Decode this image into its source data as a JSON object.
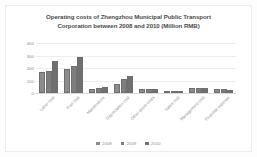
{
  "chart_data": {
    "type": "bar",
    "title": "Operating costs of Zhengzhou Municipal Public Transport Corporation between 2008 and 2010 (Million RMB)",
    "title_line1": "Operating costs of Zhengzhou Municipal Public Transport",
    "title_line2": "Corporation between 2008 and 2010 (Million RMB)",
    "xlabel": "",
    "ylabel": "",
    "ylim": [
      0,
      400
    ],
    "yticks": [
      0,
      100,
      200,
      300,
      400
    ],
    "ytick_labels": [
      "0",
      "100",
      "200",
      "300",
      "400"
    ],
    "grid": true,
    "legend_position": "bottom",
    "categories": [
      "Labor cost",
      "Fuel cost",
      "Maintenance",
      "Depreciation cost",
      "Other direct costs",
      "Sales cost",
      "Management cost",
      "Financial expense"
    ],
    "series": [
      {
        "name": "2008",
        "color": "#8c8c8c",
        "values": [
          165,
          195,
          30,
          75,
          35,
          18,
          40,
          35
        ]
      },
      {
        "name": "2009",
        "color": "#7d7d7d",
        "values": [
          180,
          215,
          38,
          110,
          35,
          18,
          42,
          30
        ]
      },
      {
        "name": "2010",
        "color": "#6f6f6f",
        "values": [
          255,
          290,
          45,
          135,
          35,
          18,
          42,
          28
        ]
      }
    ]
  }
}
